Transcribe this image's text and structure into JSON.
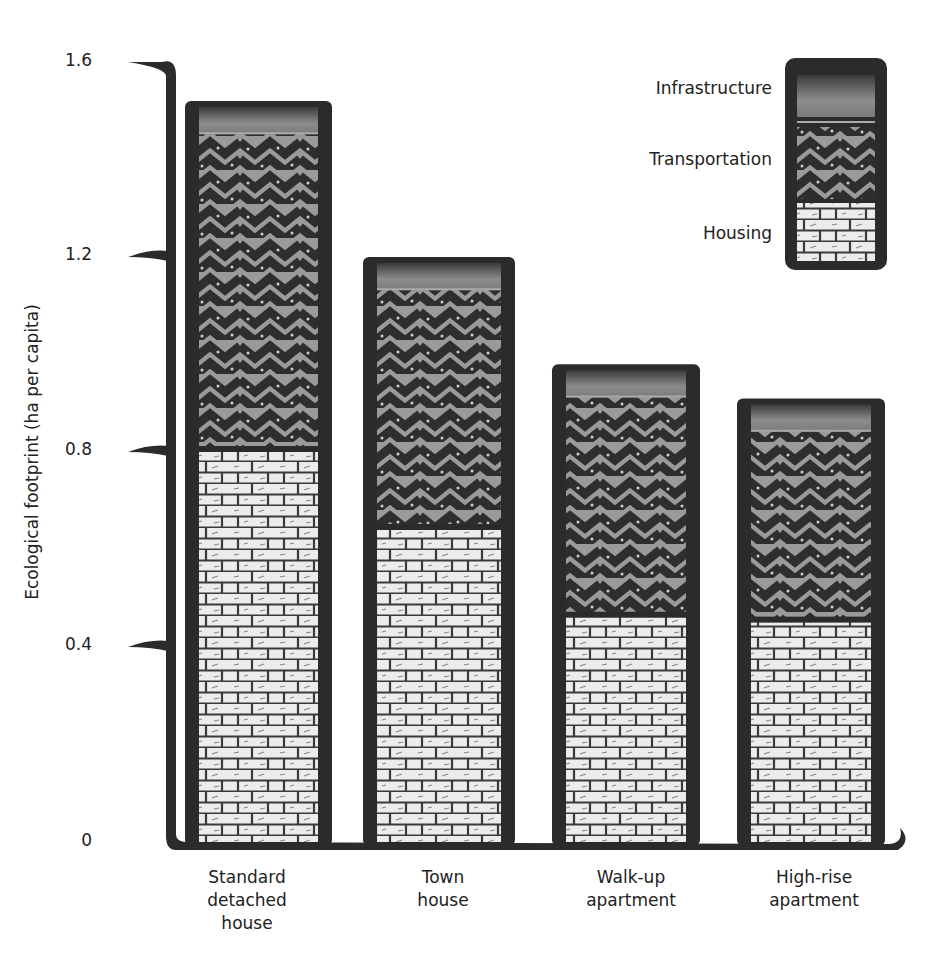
{
  "chart_data": {
    "type": "bar",
    "stacked": true,
    "title": "",
    "xlabel": "",
    "ylabel": "Ecological footprint (ha per capita)",
    "ylim": [
      0,
      1.6
    ],
    "yticks": [
      "0",
      "0.4",
      "0.8",
      "1.2",
      "1.6"
    ],
    "grid": false,
    "legend_position": "top-right",
    "categories": [
      "Standard\ndetached\nhouse",
      "Town\nhouse",
      "Walk-up\napartment",
      "High-rise\napartment"
    ],
    "series": [
      {
        "name": "Housing",
        "values": [
          0.8,
          0.64,
          0.46,
          0.45
        ],
        "pattern": "brick"
      },
      {
        "name": "Transportation",
        "values": [
          0.66,
          0.5,
          0.46,
          0.4
        ],
        "pattern": "zigzag"
      },
      {
        "name": "Infrastructure",
        "values": [
          0.06,
          0.06,
          0.06,
          0.06
        ],
        "pattern": "gradient"
      }
    ],
    "totals": [
      1.52,
      1.2,
      0.98,
      0.91
    ]
  },
  "legend": {
    "items": [
      "Infrastructure",
      "Transportation",
      "Housing"
    ]
  },
  "colors": {
    "outline": "#2b2b2b",
    "brick_fill": "#ececec",
    "zigzag_light": "#9a9a9a",
    "zigzag_dark": "#2e2e2e",
    "infra_light": "#8c8c8c"
  }
}
